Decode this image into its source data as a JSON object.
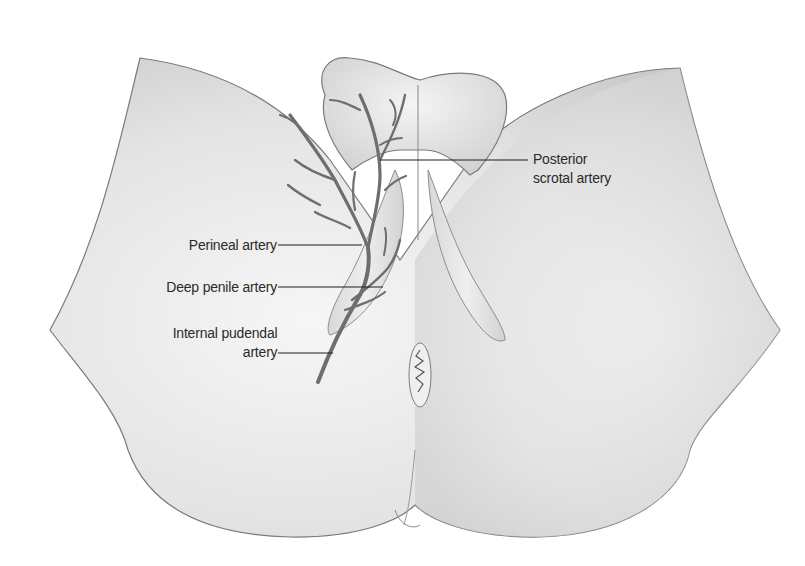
{
  "figure": {
    "background_color": "#ffffff",
    "skin_tone": "#e2e2e2",
    "artery_color": "#6e6e6e",
    "leader_line_color": "#1e1e1e"
  },
  "labels": [
    {
      "id": "posterior-scrotal-artery",
      "lines": [
        "Posterior",
        "scrotal artery"
      ]
    },
    {
      "id": "perineal-artery",
      "lines": [
        "Perineal artery"
      ]
    },
    {
      "id": "deep-penile-artery",
      "lines": [
        "Deep penile artery"
      ]
    },
    {
      "id": "internal-pudendal-artery",
      "lines": [
        "Internal pudendal",
        "artery"
      ]
    }
  ]
}
